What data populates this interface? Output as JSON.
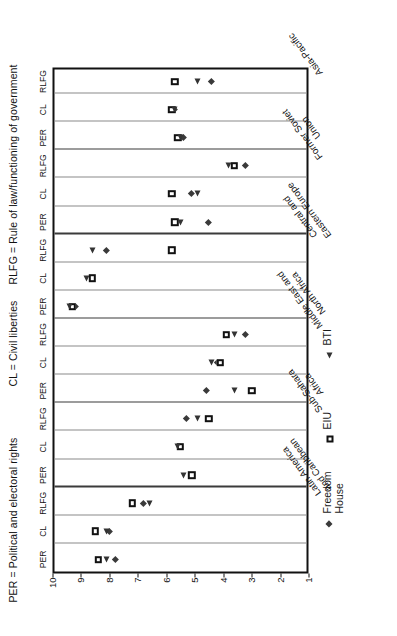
{
  "header": {
    "note_per": "PER = Political and electoral rights",
    "note_cl": "CL = Civil liberties",
    "note_rlfg": "RLFG = Rule of law/functioning of government"
  },
  "chart_data": {
    "type": "scatter",
    "title": "",
    "xlabel": "",
    "ylabel": "",
    "ylim": [
      1,
      10
    ],
    "yticks": [
      "10",
      "9",
      "8",
      "7",
      "6",
      "5",
      "4",
      "3",
      "2",
      "1"
    ],
    "grid": true,
    "legend_position": "below-axis",
    "dimensions": [
      "PER",
      "CL",
      "RLFG"
    ],
    "categories": [
      "Latin America\nand Caribbean",
      "Sub-Sahara\nAfrica",
      "Middle East and\nNorth Africa",
      "Central and\nEastern Europe",
      "Former Soviet\nUnion",
      "Asia-Pacific"
    ],
    "series": [
      {
        "name": "Freedom House",
        "marker": "diamond",
        "color": "#3a3a3a",
        "values": {
          "Latin America and Caribbean": {
            "PER": 7.8,
            "CL": 8.0,
            "RLFG": 6.8
          },
          "Sub-Sahara Africa": {
            "PER": null,
            "CL": 5.5,
            "RLFG": 5.3
          },
          "Middle East and North Africa": {
            "PER": 4.6,
            "CL": 4.2,
            "RLFG": 3.2
          },
          "Central and Eastern Europe": {
            "PER": 9.2,
            "CL": null,
            "RLFG": 8.1
          },
          "Former Soviet Union": {
            "PER": 4.5,
            "CL": 5.1,
            "RLFG": 3.2
          },
          "Asia-Pacific": {
            "PER": 5.4,
            "CL": 5.7,
            "RLFG": 4.4
          }
        }
      },
      {
        "name": "EIU",
        "marker": "square",
        "color": "#111111",
        "values": {
          "Latin America and Caribbean": {
            "PER": 8.4,
            "CL": 8.5,
            "RLFG": 7.2
          },
          "Sub-Sahara Africa": {
            "PER": 5.1,
            "CL": 5.5,
            "RLFG": 4.5
          },
          "Middle East and North Africa": {
            "PER": 3.0,
            "CL": 4.1,
            "RLFG": 3.9
          },
          "Central and Eastern Europe": {
            "PER": 9.3,
            "CL": 8.6,
            "RLFG": 5.8
          },
          "Former Soviet Union": {
            "PER": 5.7,
            "CL": 5.8,
            "RLFG": 3.6
          },
          "Asia-Pacific": {
            "PER": 5.6,
            "CL": 5.8,
            "RLFG": 5.7
          }
        }
      },
      {
        "name": "BTI",
        "marker": "triangle",
        "color": "#333333",
        "values": {
          "Latin America and Caribbean": {
            "PER": 8.1,
            "CL": 8.1,
            "RLFG": 6.6
          },
          "Sub-Sahara Africa": {
            "PER": 5.4,
            "CL": 5.6,
            "RLFG": 4.9
          },
          "Middle East and North Africa": {
            "PER": 3.6,
            "CL": 4.4,
            "RLFG": 3.6
          },
          "Central and Eastern Europe": {
            "PER": 9.4,
            "CL": 8.8,
            "RLFG": 8.6
          },
          "Former Soviet Union": {
            "PER": 5.5,
            "CL": 4.9,
            "RLFG": 3.8
          },
          "Asia-Pacific": {
            "PER": 5.5,
            "CL": 5.7,
            "RLFG": 4.9
          }
        }
      }
    ],
    "legend": [
      {
        "label": "Freedom\nHouse",
        "marker": "diamond"
      },
      {
        "label": "EIU",
        "marker": "square"
      },
      {
        "label": "BTI",
        "marker": "triangle"
      }
    ]
  }
}
